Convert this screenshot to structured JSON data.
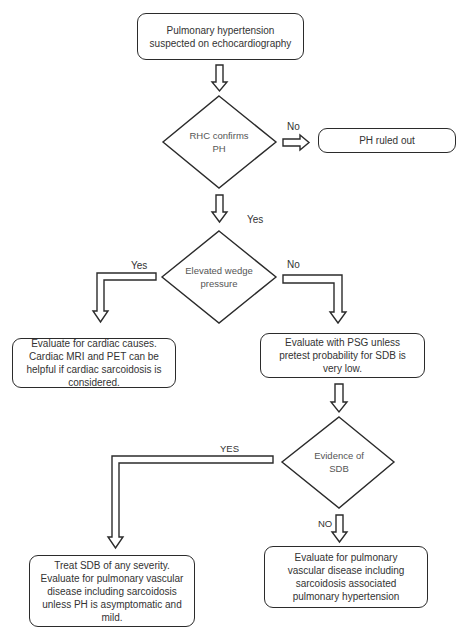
{
  "flowchart": {
    "start": {
      "text": "Pulmonary hypertension suspected on echocardiography"
    },
    "decision_rhc": {
      "text": "RHC confirms PH"
    },
    "ph_ruled_out": {
      "text": "PH ruled out"
    },
    "decision_wedge": {
      "text": "Elevated wedge pressure"
    },
    "cardiac_eval": {
      "text": "Evaluate for cardiac causes. Cardiac MRI and PET can be helpful if cardiac sarcoidosis is considered."
    },
    "psg_eval": {
      "text": "Evaluate with PSG unless pretest probability for SDB is very low."
    },
    "decision_sdb": {
      "text": "Evidence of SDB"
    },
    "treat_sdb": {
      "text": "Treat SDB of any severity. Evaluate for pulmonary vascular disease including sarcoidosis unless PH is asymptomatic and mild."
    },
    "pulm_vascular_eval": {
      "text": "Evaluate for pulmonary vascular disease including sarcoidosis associated pulmonary hypertension"
    },
    "edge_labels": {
      "rhc_no": "No",
      "rhc_yes": "Yes",
      "wedge_yes": "Yes",
      "wedge_no": "No",
      "sdb_yes": "YES",
      "sdb_no": "NO"
    }
  },
  "colors": {
    "stroke": "#2b2b2b",
    "text": "#333333",
    "background": "#ffffff"
  }
}
